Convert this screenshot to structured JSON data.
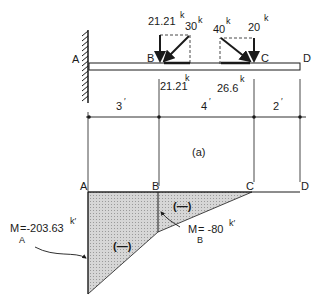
{
  "beam": {
    "points": {
      "A": "A",
      "B": "B",
      "C": "C",
      "D": "D"
    },
    "loads": [
      {
        "name": "load-B-vertical",
        "value": "21.21",
        "unit": "k"
      },
      {
        "name": "load-B-inclined",
        "value": "30",
        "unit": "k"
      },
      {
        "name": "load-C-inclined",
        "value": "40",
        "unit": "k"
      },
      {
        "name": "load-C-vertical",
        "value": "20",
        "unit": "k"
      }
    ],
    "horizontal_components": [
      {
        "name": "horiz-B",
        "value": "21.21",
        "unit": "k"
      },
      {
        "name": "horiz-C",
        "value": "26.6",
        "unit": "k"
      }
    ]
  },
  "dimensions": [
    {
      "span": "A-B",
      "label": "3",
      "unit": "′"
    },
    {
      "span": "B-C",
      "label": "4",
      "unit": "′"
    },
    {
      "span": "C-D",
      "label": "2",
      "unit": "′"
    }
  ],
  "caption": "(a)",
  "moment_diagram": {
    "points": {
      "A": "A",
      "B": "B",
      "C": "C",
      "D": "D"
    },
    "region_signs": [
      "(—)",
      "(—)"
    ],
    "annotations": {
      "MA": {
        "symbol": "M",
        "subscript": "A",
        "value": "=-203.63",
        "unit": "k′"
      },
      "MB": {
        "symbol": "M",
        "subscript": "B",
        "value": "= -80",
        "unit": "k′"
      }
    }
  }
}
